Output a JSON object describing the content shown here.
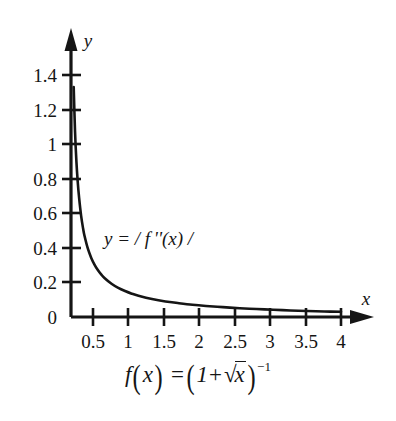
{
  "figure": {
    "background": "#ffffff",
    "ink_color": "#151515",
    "axis_labels": {
      "x": "x",
      "y": "y"
    },
    "curve_label": "y = / f ''(x) /",
    "formula": {
      "lhs": "f",
      "lhs_arg_open": "(",
      "lhs_var": "x",
      "lhs_arg_close": ")",
      "equals": "=",
      "open_paren": "(",
      "one": "1",
      "plus": "+",
      "radical_sign": "√",
      "radical_arg": "x",
      "close_paren": ")",
      "exponent": "−1",
      "plain_text": "f(x) = (1 + √x)^−1"
    }
  },
  "chart_data": {
    "type": "line",
    "title": "",
    "subtitle": "",
    "xlabel": "x",
    "ylabel": "y",
    "legend": [],
    "annotations": [
      {
        "text": "y = / f ''(x) /",
        "x": 1.0,
        "y": 0.45
      },
      {
        "text": "f(x) = (1 + √x)^−1",
        "x": 2.0,
        "y": -0.22
      }
    ],
    "grid": false,
    "xlim": [
      0,
      4.3
    ],
    "ylim": [
      0,
      1.5
    ],
    "xticks": [
      0.5,
      1,
      1.5,
      2,
      2.5,
      3,
      3.5,
      4
    ],
    "xtick_labels": [
      "0.5",
      "1",
      "1.5",
      "2",
      "2.5",
      "3",
      "3.5",
      "4"
    ],
    "yticks": [
      0,
      0.2,
      0.4,
      0.6,
      0.8,
      1,
      1.2,
      1.4
    ],
    "ytick_labels": [
      "0",
      "0.2",
      "0.4",
      "0.6",
      "0.8",
      "1",
      "1.2",
      "1.4"
    ],
    "axis_arrows": {
      "x": true,
      "y": true
    },
    "series": [
      {
        "name": "y = / f''(x) /",
        "expression": "abs(second derivative of (1+sqrt(x))^-1)",
        "x": [
          0.04,
          0.06,
          0.08,
          0.1,
          0.12,
          0.15,
          0.18,
          0.2,
          0.25,
          0.3,
          0.35,
          0.4,
          0.45,
          0.5,
          0.6,
          0.7,
          0.8,
          0.9,
          1.0,
          1.2,
          1.4,
          1.6,
          1.8,
          2.0,
          2.25,
          2.5,
          2.75,
          3.0,
          3.25,
          3.5,
          3.75,
          4.0
        ],
        "y": [
          1.33,
          1.07,
          0.9,
          0.78,
          0.69,
          0.585,
          0.51,
          0.47,
          0.395,
          0.342,
          0.302,
          0.27,
          0.245,
          0.224,
          0.192,
          0.168,
          0.15,
          0.135,
          0.123,
          0.104,
          0.09,
          0.08,
          0.071,
          0.064,
          0.057,
          0.051,
          0.046,
          0.042,
          0.038,
          0.035,
          0.032,
          0.03
        ]
      }
    ]
  }
}
